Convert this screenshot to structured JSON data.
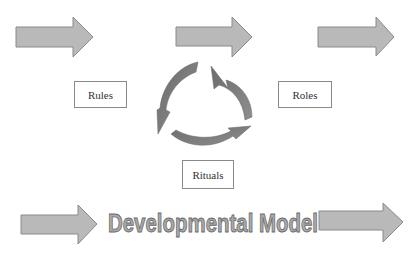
{
  "diagram": {
    "title": "Developmental Model",
    "nodes": [
      {
        "id": "rules",
        "label": "Rules"
      },
      {
        "id": "roles",
        "label": "Roles"
      },
      {
        "id": "rituals",
        "label": "Rituals"
      }
    ],
    "cycle": {
      "description": "three curved arrows forming a cycle between Rules, Roles, Rituals"
    },
    "arrows": {
      "top_count": 3,
      "bottom_count": 2
    },
    "colors": {
      "arrow_fill": "#b8b8b8",
      "arrow_stroke": "#888888",
      "cycle_fill": "#7a7a7a",
      "title_fill": "#a8a8a8",
      "title_stroke": "#6e6e6e"
    }
  }
}
